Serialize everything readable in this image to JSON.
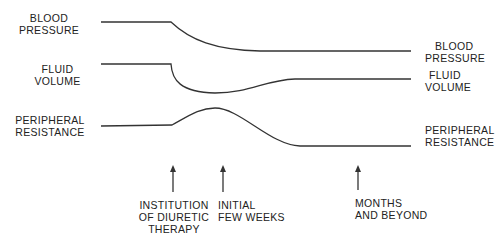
{
  "left_labels": {
    "blood_pressure": [
      "BLOOD",
      "PRESSURE"
    ],
    "fluid_volume": [
      "FLUID",
      "VOLUME"
    ],
    "peripheral_resistance": [
      "PERIPHERAL",
      "RESISTANCE"
    ]
  },
  "right_labels": {
    "blood_pressure": [
      "BLOOD",
      "PRESSURE"
    ],
    "fluid_volume": [
      "FLUID",
      "VOLUME"
    ],
    "peripheral_resistance": [
      "PERIPHERAL",
      "RESISTANCE"
    ]
  },
  "time_markers": [
    {
      "lines": [
        "INSTITUTION",
        "OF DIURETIC",
        "THERAPY"
      ]
    },
    {
      "lines": [
        "INITIAL",
        "FEW WEEKS"
      ]
    },
    {
      "lines": [
        "MONTHS",
        "AND BEYOND"
      ]
    }
  ],
  "colors": {
    "line": "#333333"
  }
}
